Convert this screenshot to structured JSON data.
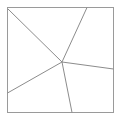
{
  "figure": {
    "type": "line-diagram",
    "canvas": {
      "width": 122,
      "height": 121,
      "background": "#ffffff"
    },
    "style": {
      "border_color": "#9a9a9a",
      "border_width": 1,
      "line_color": "#8c8c8c",
      "line_width": 1,
      "fill": "none"
    },
    "square": {
      "name": "outer-square",
      "x": 7.5,
      "y": 7.5,
      "width": 106,
      "height": 105,
      "corners": {
        "top_left": [
          7.5,
          7.5
        ],
        "top_right": [
          113.5,
          7.5
        ],
        "bottom_right": [
          113.5,
          112.5
        ],
        "bottom_left": [
          7.5,
          112.5
        ]
      }
    },
    "interior_point": {
      "name": "center-vertex",
      "x": 62,
      "y": 62,
      "degree": 5
    },
    "segments": [
      {
        "id": "seg-to-top-left-corner",
        "label": "segment to top-left corner",
        "from": [
          62,
          62
        ],
        "to": [
          8,
          9
        ],
        "endpoint_edge": "corner-top-left"
      },
      {
        "id": "seg-to-top-edge",
        "label": "segment to top edge",
        "from": [
          62,
          62
        ],
        "to": [
          87,
          7.5
        ],
        "endpoint_edge": "top"
      },
      {
        "id": "seg-to-right-edge",
        "label": "segment to right edge",
        "from": [
          62,
          62
        ],
        "to": [
          113.5,
          69
        ],
        "endpoint_edge": "right"
      },
      {
        "id": "seg-to-bottom-edge",
        "label": "segment to bottom edge",
        "from": [
          62,
          62
        ],
        "to": [
          72,
          112.5
        ],
        "endpoint_edge": "bottom"
      },
      {
        "id": "seg-to-left-edge",
        "label": "segment to left edge",
        "from": [
          62,
          62
        ],
        "to": [
          7.5,
          93
        ],
        "endpoint_edge": "left"
      }
    ],
    "region_count": 5,
    "labels": []
  }
}
